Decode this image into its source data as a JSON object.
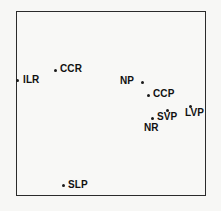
{
  "figure": {
    "kind": "labeled-scatter-plot",
    "background_color": "#f7f7f5",
    "frame_color": "#2b2b2b",
    "marker_color": "#1a1a1a",
    "label_color": "#111111"
  },
  "chart_data": {
    "type": "scatter",
    "title": "",
    "xlabel": "",
    "ylabel": "",
    "grid": false,
    "legend": "none",
    "axis_ticks": "none",
    "xlim": [
      0,
      100
    ],
    "ylim": [
      0,
      100
    ],
    "points": [
      {
        "label": "ILR",
        "x": 0.0,
        "y": 62.7,
        "px": 17,
        "py": 80,
        "label_px": 23,
        "label_py": 75
      },
      {
        "label": "CCR",
        "x": 20.5,
        "y": 68.1,
        "px": 55,
        "py": 70,
        "label_px": 60,
        "label_py": 64
      },
      {
        "label": "NP",
        "x": 66.3,
        "y": 61.6,
        "px": 142,
        "py": 82,
        "label_px": 120,
        "label_py": 76
      },
      {
        "label": "CCP",
        "x": 69.5,
        "y": 54.6,
        "px": 148,
        "py": 95,
        "label_px": 153,
        "label_py": 89
      },
      {
        "label": "SVP",
        "x": 79.5,
        "y": 46.5,
        "px": 167,
        "py": 110,
        "label_px": 157,
        "label_py": 112
      },
      {
        "label": "LVP",
        "x": 91.6,
        "y": 48.6,
        "px": 190,
        "py": 106,
        "label_px": 185,
        "label_py": 108
      },
      {
        "label": "NR",
        "x": 71.6,
        "y": 42.2,
        "px": 152,
        "py": 118,
        "label_px": 144,
        "label_py": 123
      },
      {
        "label": "SLP",
        "x": 24.7,
        "y": 5.9,
        "px": 63,
        "py": 185,
        "label_px": 68,
        "label_py": 180
      }
    ]
  }
}
